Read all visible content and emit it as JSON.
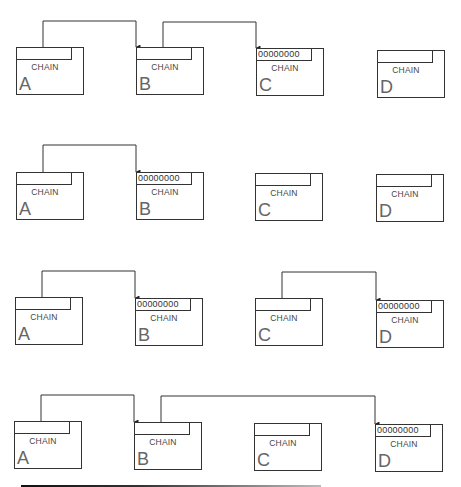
{
  "diagram": {
    "field_label": "CHAIN",
    "null_value": "00000000",
    "rows": [
      {
        "boxes": [
          {
            "name": "A",
            "x": 16,
            "y": 47,
            "value": ""
          },
          {
            "name": "B",
            "x": 136,
            "y": 47,
            "value": ""
          },
          {
            "name": "C",
            "x": 256,
            "y": 48,
            "value": "00000000"
          },
          {
            "name": "D",
            "x": 377,
            "y": 50,
            "value": ""
          }
        ],
        "links": [
          {
            "from": "A",
            "to": "B",
            "y": 21
          },
          {
            "from": "B",
            "to": "C",
            "y": 22
          }
        ]
      },
      {
        "boxes": [
          {
            "name": "A",
            "x": 16,
            "y": 172,
            "value": ""
          },
          {
            "name": "B",
            "x": 136,
            "y": 172,
            "value": "00000000"
          },
          {
            "name": "C",
            "x": 255,
            "y": 173,
            "value": ""
          },
          {
            "name": "D",
            "x": 376,
            "y": 174,
            "value": ""
          }
        ],
        "links": [
          {
            "from": "A",
            "to": "B",
            "y": 145
          }
        ]
      },
      {
        "boxes": [
          {
            "name": "A",
            "x": 15,
            "y": 297,
            "value": ""
          },
          {
            "name": "B",
            "x": 135,
            "y": 298,
            "value": "00000000"
          },
          {
            "name": "C",
            "x": 255,
            "y": 298,
            "value": ""
          },
          {
            "name": "D",
            "x": 376,
            "y": 300,
            "value": "00000000"
          }
        ],
        "links": [
          {
            "from": "A",
            "to": "B",
            "y": 271
          },
          {
            "from": "C",
            "to": "D",
            "y": 272
          }
        ]
      },
      {
        "boxes": [
          {
            "name": "A",
            "x": 14,
            "y": 421,
            "value": ""
          },
          {
            "name": "B",
            "x": 134,
            "y": 422,
            "value": ""
          },
          {
            "name": "C",
            "x": 254,
            "y": 423,
            "value": ""
          },
          {
            "name": "D",
            "x": 375,
            "y": 424,
            "value": "00000000"
          }
        ],
        "links": [
          {
            "from": "A",
            "to": "B",
            "y": 395
          },
          {
            "from": "B",
            "to": "D",
            "y": 396
          }
        ]
      }
    ]
  }
}
